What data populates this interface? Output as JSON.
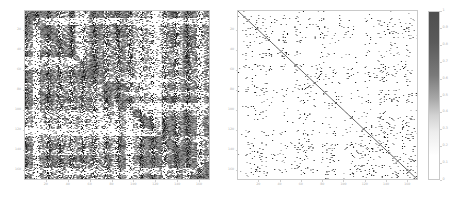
{
  "figure": {
    "background": "#ffffff",
    "width": 468,
    "height": 204,
    "tick_color": "#b0b0b0",
    "frame_color": "#c9c9c9"
  },
  "chart_data": [
    {
      "type": "heatmap",
      "name": "left-matrix",
      "title": "",
      "xlabel": "",
      "ylabel": "",
      "xticks": [
        20,
        40,
        60,
        80,
        100,
        120,
        140,
        160
      ],
      "yticks": [
        20,
        40,
        60,
        80,
        100,
        120,
        140,
        160
      ],
      "xlim": [
        0,
        170
      ],
      "ylim": [
        170,
        0
      ],
      "colormap": "gray_r",
      "vmin": 0,
      "vmax": 1,
      "grid": false,
      "density": 0.46,
      "diagonal": true,
      "description": "Dense binary-like adjacency matrix with strong diagonal and block structure"
    },
    {
      "type": "heatmap",
      "name": "right-matrix",
      "title": "",
      "xlabel": "",
      "ylabel": "",
      "xticks": [
        20,
        40,
        60,
        80,
        100,
        120,
        140,
        160
      ],
      "yticks": [
        20,
        40,
        60,
        80,
        100,
        120,
        140,
        160
      ],
      "xlim": [
        0,
        170
      ],
      "ylim": [
        170,
        0
      ],
      "colormap": "gray_r",
      "vmin": 0,
      "vmax": 1,
      "grid": false,
      "density": 0.035,
      "diagonal": true,
      "description": "Sparse adjacency matrix with prominent diagonal and scattered off-diagonal entries"
    }
  ],
  "colorbar": {
    "name": "colorbar",
    "orientation": "vertical",
    "vmin": 0,
    "vmax": 1,
    "top_color": "#4e4e4e",
    "bottom_color": "#ffffff",
    "ticks": [
      "1",
      "0.9",
      "0.8",
      "0.7",
      "0.6",
      "0.5",
      "0.4",
      "0.3",
      "0.2",
      "0.1",
      "0"
    ],
    "tick_values": [
      1,
      0.9,
      0.8,
      0.7,
      0.6,
      0.5,
      0.4,
      0.3,
      0.2,
      0.1,
      0
    ]
  }
}
